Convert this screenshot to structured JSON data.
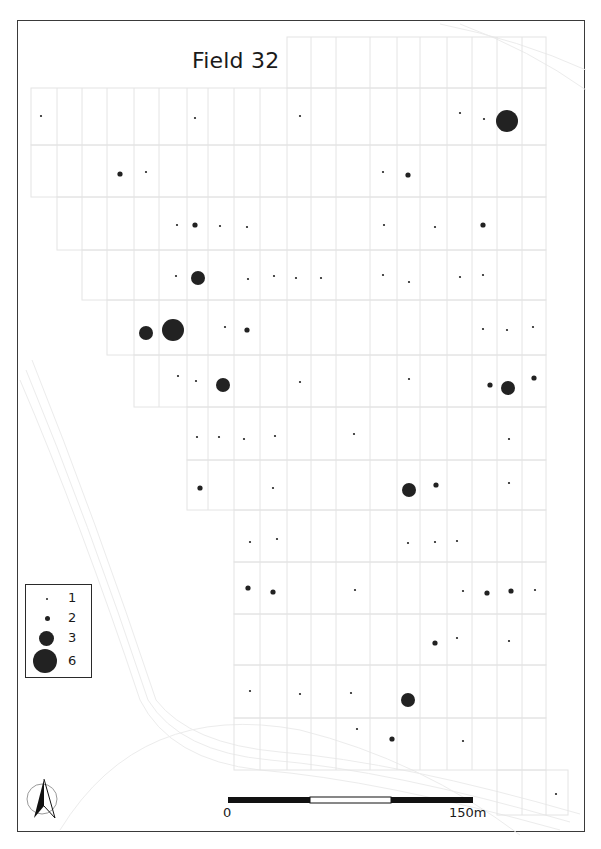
{
  "map": {
    "title": "Field 32",
    "legend": {
      "items": [
        {
          "label": "1",
          "value": 1
        },
        {
          "label": "2",
          "value": 2
        },
        {
          "label": "3",
          "value": 3
        },
        {
          "label": "6",
          "value": 6
        }
      ]
    },
    "scale_bar": {
      "start_label": "0",
      "end_label": "150m",
      "length_m": 150,
      "segments": 3
    },
    "north_arrow": "north-arrow-icon",
    "colors": {
      "point": "#222222",
      "grid": "#e4e4e4",
      "frame": "#3a3a3a",
      "contour": "#ececec"
    },
    "points": [
      {
        "x": 41,
        "y": 116,
        "v": 1
      },
      {
        "x": 195,
        "y": 118,
        "v": 1
      },
      {
        "x": 300,
        "y": 116,
        "v": 1
      },
      {
        "x": 460,
        "y": 113,
        "v": 1
      },
      {
        "x": 484,
        "y": 119,
        "v": 1
      },
      {
        "x": 507,
        "y": 121,
        "v": 6
      },
      {
        "x": 120,
        "y": 174,
        "v": 2
      },
      {
        "x": 146,
        "y": 172,
        "v": 1
      },
      {
        "x": 383,
        "y": 172,
        "v": 1
      },
      {
        "x": 408,
        "y": 175,
        "v": 2
      },
      {
        "x": 177,
        "y": 225,
        "v": 1
      },
      {
        "x": 195,
        "y": 225,
        "v": 2
      },
      {
        "x": 220,
        "y": 226,
        "v": 1
      },
      {
        "x": 247,
        "y": 227,
        "v": 1
      },
      {
        "x": 384,
        "y": 225,
        "v": 1
      },
      {
        "x": 435,
        "y": 227,
        "v": 1
      },
      {
        "x": 483,
        "y": 225,
        "v": 2
      },
      {
        "x": 176,
        "y": 276,
        "v": 1
      },
      {
        "x": 198,
        "y": 278,
        "v": 3
      },
      {
        "x": 248,
        "y": 279,
        "v": 1
      },
      {
        "x": 274,
        "y": 276,
        "v": 1
      },
      {
        "x": 296,
        "y": 278,
        "v": 1
      },
      {
        "x": 321,
        "y": 278,
        "v": 1
      },
      {
        "x": 383,
        "y": 275,
        "v": 1
      },
      {
        "x": 409,
        "y": 282,
        "v": 1
      },
      {
        "x": 460,
        "y": 277,
        "v": 1
      },
      {
        "x": 483,
        "y": 275,
        "v": 1
      },
      {
        "x": 146,
        "y": 333,
        "v": 3
      },
      {
        "x": 173,
        "y": 330,
        "v": 6
      },
      {
        "x": 225,
        "y": 327,
        "v": 1
      },
      {
        "x": 247,
        "y": 330,
        "v": 2
      },
      {
        "x": 483,
        "y": 329,
        "v": 1
      },
      {
        "x": 507,
        "y": 330,
        "v": 1
      },
      {
        "x": 533,
        "y": 327,
        "v": 1
      },
      {
        "x": 178,
        "y": 376,
        "v": 1
      },
      {
        "x": 196,
        "y": 381,
        "v": 1
      },
      {
        "x": 223,
        "y": 385,
        "v": 3
      },
      {
        "x": 300,
        "y": 382,
        "v": 1
      },
      {
        "x": 409,
        "y": 379,
        "v": 1
      },
      {
        "x": 490,
        "y": 385,
        "v": 2
      },
      {
        "x": 508,
        "y": 388,
        "v": 3
      },
      {
        "x": 534,
        "y": 378,
        "v": 2
      },
      {
        "x": 197,
        "y": 437,
        "v": 1
      },
      {
        "x": 219,
        "y": 437,
        "v": 1
      },
      {
        "x": 244,
        "y": 439,
        "v": 1
      },
      {
        "x": 275,
        "y": 436,
        "v": 1
      },
      {
        "x": 354,
        "y": 434,
        "v": 1
      },
      {
        "x": 509,
        "y": 439,
        "v": 1
      },
      {
        "x": 200,
        "y": 488,
        "v": 2
      },
      {
        "x": 273,
        "y": 488,
        "v": 1
      },
      {
        "x": 409,
        "y": 490,
        "v": 3
      },
      {
        "x": 436,
        "y": 485,
        "v": 2
      },
      {
        "x": 509,
        "y": 483,
        "v": 1
      },
      {
        "x": 250,
        "y": 542,
        "v": 1
      },
      {
        "x": 277,
        "y": 539,
        "v": 1
      },
      {
        "x": 408,
        "y": 543,
        "v": 1
      },
      {
        "x": 435,
        "y": 542,
        "v": 1
      },
      {
        "x": 457,
        "y": 541,
        "v": 1
      },
      {
        "x": 248,
        "y": 588,
        "v": 2
      },
      {
        "x": 273,
        "y": 592,
        "v": 2
      },
      {
        "x": 355,
        "y": 590,
        "v": 1
      },
      {
        "x": 463,
        "y": 591,
        "v": 1
      },
      {
        "x": 487,
        "y": 593,
        "v": 2
      },
      {
        "x": 511,
        "y": 591,
        "v": 2
      },
      {
        "x": 535,
        "y": 590,
        "v": 1
      },
      {
        "x": 435,
        "y": 643,
        "v": 2
      },
      {
        "x": 457,
        "y": 638,
        "v": 1
      },
      {
        "x": 509,
        "y": 641,
        "v": 1
      },
      {
        "x": 250,
        "y": 691,
        "v": 1
      },
      {
        "x": 300,
        "y": 694,
        "v": 1
      },
      {
        "x": 351,
        "y": 693,
        "v": 1
      },
      {
        "x": 408,
        "y": 700,
        "v": 3
      },
      {
        "x": 357,
        "y": 729,
        "v": 1
      },
      {
        "x": 392,
        "y": 739,
        "v": 2
      },
      {
        "x": 463,
        "y": 741,
        "v": 1
      },
      {
        "x": 556,
        "y": 794,
        "v": 1
      }
    ]
  }
}
